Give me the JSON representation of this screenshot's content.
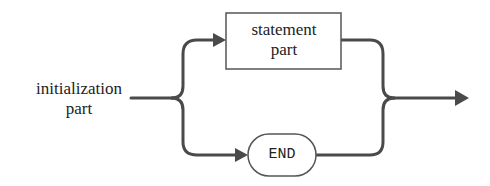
{
  "diagram": {
    "type": "syntax-diagram",
    "nodes": {
      "initialization": {
        "line1": "initialization",
        "line2": "part"
      },
      "statement": {
        "line1": "statement",
        "line2": "part",
        "shape": "rectangle"
      },
      "end": {
        "label": "END",
        "shape": "rounded-terminal"
      }
    },
    "edges": [
      {
        "from": "initialization",
        "to": "statement"
      },
      {
        "from": "initialization",
        "to": "end"
      },
      {
        "from": "statement",
        "to": "exit"
      },
      {
        "from": "end",
        "to": "exit"
      }
    ],
    "colors": {
      "line": "#4a4a4a",
      "box_border": "#555555",
      "text": "#222222",
      "background": "#ffffff"
    }
  }
}
